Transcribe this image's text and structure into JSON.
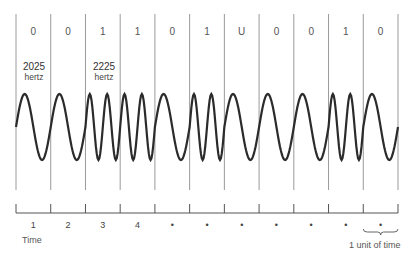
{
  "diagram": {
    "type": "FSK modulation waveform",
    "bits": [
      "0",
      "0",
      "1",
      "1",
      "0",
      "1",
      "U",
      "0",
      "0",
      "1",
      "0"
    ],
    "bit_values": [
      0,
      0,
      1,
      1,
      0,
      1,
      0,
      0,
      0,
      1,
      0
    ],
    "frequency_labels": [
      {
        "value": "2025",
        "unit": "hertz",
        "cell": 0
      },
      {
        "value": "2225",
        "unit": "hertz",
        "cell": 2
      }
    ],
    "cycles_per_cell": {
      "0": 1,
      "1": 2
    },
    "timeline": {
      "tick_labels": [
        "1",
        "2",
        "3",
        "4",
        "•",
        "•",
        "•",
        "•",
        "•",
        "•",
        "•"
      ],
      "axis_label": "Time",
      "unit_label": "1 unit of time"
    },
    "colors": {
      "wave": "#2b2b2b",
      "divider": "#9a9a9a",
      "axis": "#555555"
    }
  }
}
